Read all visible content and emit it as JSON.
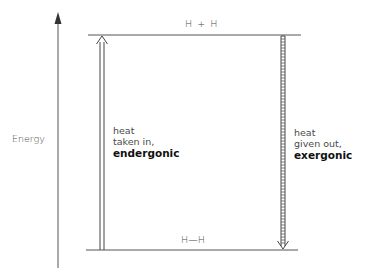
{
  "diagram": {
    "axis": {
      "label": "Energy",
      "direction": "up"
    },
    "levels": {
      "top": {
        "label": "H + H",
        "description": "higher energy level"
      },
      "bottom": {
        "label": "H—H",
        "description": "lower energy level"
      }
    },
    "arrows": {
      "endergonic": {
        "direction": "up",
        "style": "double-line",
        "lines": [
          "heat",
          "taken in,",
          "endergonic"
        ]
      },
      "exergonic": {
        "direction": "down",
        "style": "hatched",
        "lines": [
          "heat",
          "given out,",
          "exergonic"
        ]
      }
    },
    "colors": {
      "line": "#555555",
      "text": "#4a4a4a",
      "bold_text": "#111111",
      "background": "#ffffff"
    }
  }
}
